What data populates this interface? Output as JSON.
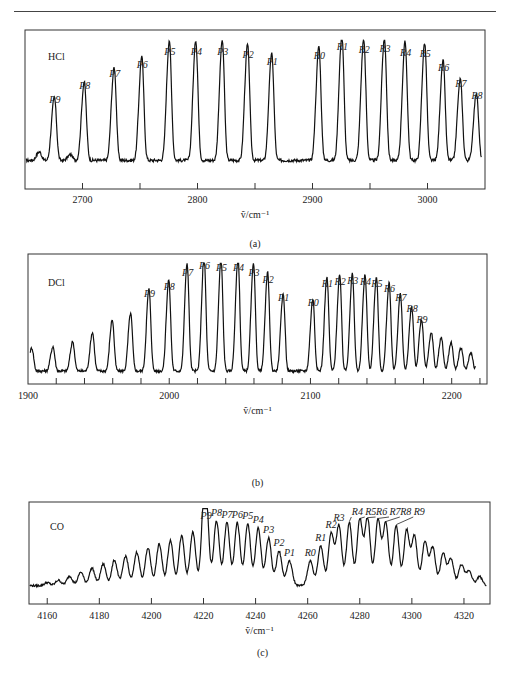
{
  "figure": {
    "panels": [
      {
        "id": "a",
        "caption": "(a)",
        "species": "HCl",
        "xlabel": "ṽ/cm⁻¹"
      },
      {
        "id": "b",
        "caption": "(b)",
        "species": "DCl",
        "xlabel": "ṽ/cm⁻¹"
      },
      {
        "id": "c",
        "caption": "(c)",
        "species": "CO",
        "xlabel": "ṽ/cm⁻¹"
      }
    ]
  },
  "chart_data": [
    {
      "type": "line",
      "title": "HCl",
      "caption": "(a)",
      "xlabel": "ṽ/cm⁻¹",
      "ylabel": "",
      "xlim": [
        2650,
        3050
      ],
      "xticks": [
        2700,
        2800,
        2900,
        3000
      ],
      "minor_xticks": [
        2750,
        2850,
        2950
      ],
      "grid": false,
      "peaks": [
        {
          "label": "P9",
          "x": 2676,
          "rel_height": 0.44
        },
        {
          "label": "P8",
          "x": 2702,
          "rel_height": 0.55
        },
        {
          "label": "P7",
          "x": 2728,
          "rel_height": 0.65
        },
        {
          "label": "P6",
          "x": 2752,
          "rel_height": 0.73
        },
        {
          "label": "P5",
          "x": 2776,
          "rel_height": 0.84
        },
        {
          "label": "P4",
          "x": 2799,
          "rel_height": 0.84
        },
        {
          "label": "P3",
          "x": 2822,
          "rel_height": 0.84
        },
        {
          "label": "P2",
          "x": 2844,
          "rel_height": 0.81
        },
        {
          "label": "P1",
          "x": 2865,
          "rel_height": 0.75
        },
        {
          "label": "R0",
          "x": 2906,
          "rel_height": 0.8
        },
        {
          "label": "R1",
          "x": 2926,
          "rel_height": 0.88
        },
        {
          "label": "R2",
          "x": 2945,
          "rel_height": 0.85
        },
        {
          "label": "R3",
          "x": 2963,
          "rel_height": 0.86
        },
        {
          "label": "R4",
          "x": 2981,
          "rel_height": 0.83
        },
        {
          "label": "R5",
          "x": 2998,
          "rel_height": 0.82
        },
        {
          "label": "R6",
          "x": 3014,
          "rel_height": 0.7
        },
        {
          "label": "R7",
          "x": 3029,
          "rel_height": 0.57
        },
        {
          "label": "R8",
          "x": 3043,
          "rel_height": 0.47
        }
      ]
    },
    {
      "type": "line",
      "title": "DCl",
      "caption": "(b)",
      "xlabel": "ṽ/cm⁻¹",
      "ylabel": "",
      "xlim": [
        1900,
        2225
      ],
      "xticks": [
        1900,
        2000,
        2100,
        2200
      ],
      "grid": false,
      "peaks": [
        {
          "label": "P9",
          "x": 1986,
          "rel_height": 0.64
        },
        {
          "label": "P8",
          "x": 2000,
          "rel_height": 0.71
        },
        {
          "label": "P7",
          "x": 2013,
          "rel_height": 0.84
        },
        {
          "label": "P6",
          "x": 2025,
          "rel_height": 0.9
        },
        {
          "label": "P5",
          "x": 2037,
          "rel_height": 0.88
        },
        {
          "label": "P4",
          "x": 2049,
          "rel_height": 0.88
        },
        {
          "label": "P3",
          "x": 2060,
          "rel_height": 0.84
        },
        {
          "label": "P2",
          "x": 2070,
          "rel_height": 0.77
        },
        {
          "label": "P1",
          "x": 2081,
          "rel_height": 0.6
        },
        {
          "label": "R0",
          "x": 2102,
          "rel_height": 0.56
        },
        {
          "label": "R1",
          "x": 2112,
          "rel_height": 0.73
        },
        {
          "label": "R2",
          "x": 2121,
          "rel_height": 0.75
        },
        {
          "label": "R3",
          "x": 2130,
          "rel_height": 0.76
        },
        {
          "label": "R4",
          "x": 2139,
          "rel_height": 0.75
        },
        {
          "label": "R5",
          "x": 2147,
          "rel_height": 0.73
        },
        {
          "label": "R6",
          "x": 2156,
          "rel_height": 0.69
        },
        {
          "label": "R7",
          "x": 2164,
          "rel_height": 0.6
        },
        {
          "label": "R8",
          "x": 2172,
          "rel_height": 0.5
        },
        {
          "label": "R9",
          "x": 2179,
          "rel_height": 0.4
        }
      ]
    },
    {
      "type": "line",
      "title": "CO",
      "caption": "(c)",
      "xlabel": "ṽ/cm⁻¹",
      "ylabel": "",
      "xlim": [
        4153,
        4330
      ],
      "xticks": [
        4160,
        4180,
        4200,
        4220,
        4240,
        4260,
        4280,
        4300,
        4320
      ],
      "grid": false,
      "peaks": [
        {
          "label": "P9",
          "x": 4221,
          "rel_height": 0.8
        },
        {
          "label": "P8",
          "x": 4225,
          "rel_height": 0.84
        },
        {
          "label": "P7",
          "x": 4229,
          "rel_height": 0.82
        },
        {
          "label": "P6",
          "x": 4233,
          "rel_height": 0.82
        },
        {
          "label": "P5",
          "x": 4237,
          "rel_height": 0.8
        },
        {
          "label": "P4",
          "x": 4241,
          "rel_height": 0.75
        },
        {
          "label": "P3",
          "x": 4245,
          "rel_height": 0.62
        },
        {
          "label": "P2",
          "x": 4249,
          "rel_height": 0.45
        },
        {
          "label": "P1",
          "x": 4253,
          "rel_height": 0.32
        },
        {
          "label": "R0",
          "x": 4261,
          "rel_height": 0.32
        },
        {
          "label": "R1",
          "x": 4265,
          "rel_height": 0.52
        },
        {
          "label": "R2",
          "x": 4269,
          "rel_height": 0.68
        },
        {
          "label": "R3",
          "x": 4272,
          "rel_height": 0.78
        },
        {
          "label": "R4",
          "x": 4276,
          "rel_height": 0.82
        },
        {
          "label": "R5",
          "x": 4280,
          "rel_height": 0.86
        },
        {
          "label": "R6",
          "x": 4283,
          "rel_height": 0.87
        },
        {
          "label": "R7",
          "x": 4287,
          "rel_height": 0.86
        },
        {
          "label": "R8",
          "x": 4290,
          "rel_height": 0.82
        },
        {
          "label": "R9",
          "x": 4294,
          "rel_height": 0.78
        }
      ]
    }
  ]
}
